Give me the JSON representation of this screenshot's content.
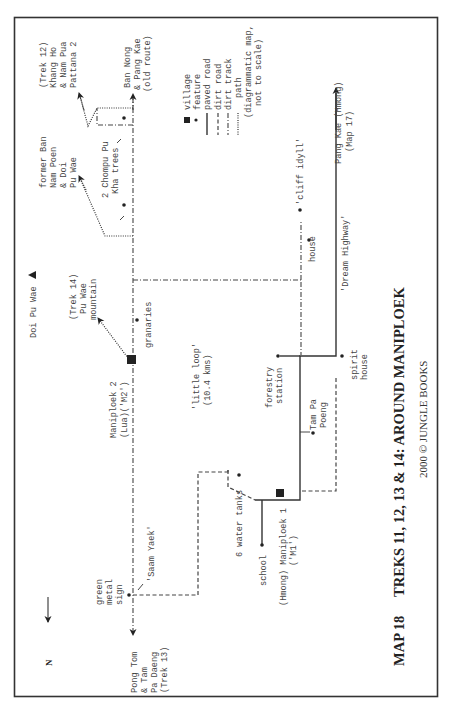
{
  "map": {
    "title": "TREKS 11, 12, 13 & 14:  AROUND MANIPLOEK",
    "map_number": "MAP 18",
    "copyright": "2000 © JUNGLE BOOKS",
    "north_label": "N",
    "legend": {
      "items": [
        {
          "symbol": "square",
          "label": "village"
        },
        {
          "symbol": "dot",
          "label": "feature"
        },
        {
          "symbol": "solid-line",
          "label": "paved road"
        },
        {
          "symbol": "dashed-line",
          "label": "dirt road"
        },
        {
          "symbol": "dash-dot-line",
          "label": "dirt track"
        },
        {
          "symbol": "dotted-line",
          "label": "path"
        }
      ],
      "note_line1": "(diagrammatic map,",
      "note_line2": "not to scale)"
    },
    "labels": {
      "trek12_line1": "(Trek 12)",
      "trek12_line2": "Khang Ho",
      "trek12_line3": "& Nam Pua",
      "trek12_line4": "Pattana 2",
      "bannong_line1": "Ban Nong",
      "bannong_line2": "& Pang Kae",
      "bannong_line3": "(old route)",
      "formerban_line1": "former Ban",
      "formerban_line2": "Nam Poen",
      "formerban_line3": "& Doi",
      "formerban_line4": "Pu Wae",
      "chompu_line1": "2 Chompu Pu",
      "chompu_line2": "Kha trees",
      "doipuwae": "Doi Pu Wae",
      "trek14_line1": "(Trek 14)",
      "trek14_line2": "Pu Wae",
      "trek14_line3": "mountain",
      "granaries": "granaries",
      "m2_line1": "Maniploek 2",
      "m2_line2": "(Lua)('M2')",
      "little_loop_line1": "'little loop'",
      "little_loop_line2": "(10.4 kms)",
      "cliff_idyll": "'cliff idyll'",
      "house": "house",
      "dream_highway": "'Dream Highway'",
      "pangkae_line1": "Pang Kae (Hmong)",
      "pangkae_line2": "(Map 17)",
      "forestry_line1": "forestry",
      "forestry_line2": "station",
      "spirit_line1": "spirit",
      "spirit_line2": "house",
      "tampa_line1": "Tam Pa",
      "tampa_line2": "Poeng",
      "water_tanks": "6 water tanks",
      "school": "school",
      "m1_line1": "(Hmong) Maniploek 1",
      "m1_line2": "('M1')",
      "green_line1": "green",
      "green_line2": "metal",
      "green_line3": "sign",
      "saam_yaek": "'Saam Yaek'",
      "pongtom_line1": "Pong Tom",
      "pongtom_line2": "& Tam",
      "pongtom_line3": "Pa Daeng",
      "pongtom_line4": "(Trek 13)"
    },
    "colors": {
      "ink": "#333333",
      "text": "#444444",
      "border": "#333333",
      "background": "#ffffff"
    }
  }
}
